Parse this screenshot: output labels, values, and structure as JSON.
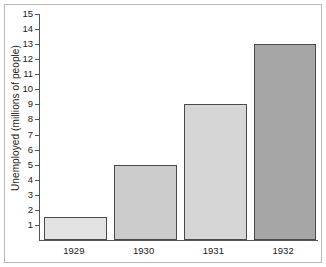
{
  "chart_data": {
    "type": "bar",
    "title": "",
    "subtitle": "",
    "xlabel": "",
    "ylabel": "Unemployed (millions of people)",
    "categories": [
      "1929",
      "1930",
      "1931",
      "1932"
    ],
    "values": [
      1.5,
      5,
      9,
      13
    ],
    "series": [
      {
        "name": "Unemployed",
        "values": [
          1.5,
          5,
          9,
          13
        ]
      }
    ],
    "ylim": [
      0,
      15
    ],
    "xlim_categories": 4,
    "ytick_labels": [
      "1",
      "2",
      "3",
      "4",
      "5",
      "6",
      "7",
      "8",
      "9",
      "10",
      "11",
      "12",
      "13",
      "14",
      "15"
    ],
    "ytick_values": [
      1,
      2,
      3,
      4,
      5,
      6,
      7,
      8,
      9,
      10,
      11,
      12,
      13,
      14,
      15
    ],
    "grid": false,
    "legend": false,
    "legend_position": "none",
    "annotations": [],
    "bar_colors": [
      "#e3e3e3",
      "#cccccc",
      "#d6d6d6",
      "#a6a6a6"
    ],
    "bar_edge_color": "#4a4a4a",
    "axis_color": "#555555",
    "frame_color": "#b9b9b9",
    "background_color": "#ffffff",
    "text_color": "#222222"
  }
}
